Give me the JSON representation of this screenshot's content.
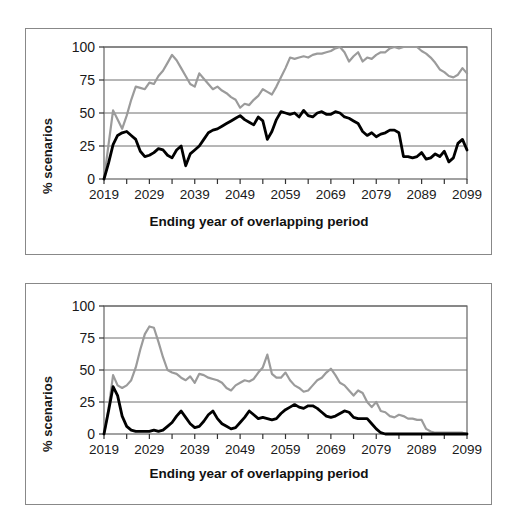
{
  "figure": {
    "background_color": "#ffffff",
    "frame_color": "#888888",
    "panel_count": 2
  },
  "chart_data": [
    {
      "id": "top-chart",
      "type": "line",
      "title": "",
      "subtitle": "",
      "xlabel": "Ending year of overlapping period",
      "ylabel": "% scenarios",
      "xlim": [
        2019,
        2099
      ],
      "ylim": [
        0,
        100
      ],
      "grid": "horizontal",
      "legend": "none",
      "xticks": [
        2019,
        2029,
        2039,
        2049,
        2059,
        2069,
        2079,
        2089,
        2099
      ],
      "xtick_labels": [
        "2019",
        "2029",
        "2039",
        "2049",
        "2059",
        "2069",
        "2079",
        "2089",
        "2099"
      ],
      "yticks": [
        0,
        25,
        50,
        75,
        100
      ],
      "ytick_labels": [
        "0",
        "25",
        "50",
        "75",
        "100"
      ],
      "x": [
        2019,
        2020,
        2021,
        2022,
        2023,
        2024,
        2025,
        2026,
        2027,
        2028,
        2029,
        2030,
        2031,
        2032,
        2033,
        2034,
        2035,
        2036,
        2037,
        2038,
        2039,
        2040,
        2041,
        2042,
        2043,
        2044,
        2045,
        2046,
        2047,
        2048,
        2049,
        2050,
        2051,
        2052,
        2053,
        2054,
        2055,
        2056,
        2057,
        2058,
        2059,
        2060,
        2061,
        2062,
        2063,
        2064,
        2065,
        2066,
        2067,
        2068,
        2069,
        2070,
        2071,
        2072,
        2073,
        2074,
        2075,
        2076,
        2077,
        2078,
        2079,
        2080,
        2081,
        2082,
        2083,
        2084,
        2085,
        2086,
        2087,
        2088,
        2089,
        2090,
        2091,
        2092,
        2093,
        2094,
        2095,
        2096,
        2097,
        2098,
        2099
      ],
      "series": [
        {
          "name": "gray-series",
          "color": "#9b9b9b",
          "width": 2.2,
          "values": [
            0,
            26,
            52,
            45,
            38,
            48,
            60,
            70,
            69,
            68,
            73,
            72,
            78,
            82,
            88,
            94,
            90,
            84,
            78,
            72,
            70,
            80,
            76,
            72,
            68,
            70,
            67,
            65,
            62,
            60,
            54,
            57,
            56,
            60,
            63,
            68,
            66,
            64,
            70,
            77,
            84,
            92,
            91,
            92,
            93,
            92,
            94,
            95,
            95,
            96,
            97,
            99,
            100,
            96,
            89,
            93,
            96,
            89,
            92,
            91,
            94,
            96,
            96,
            99,
            100,
            99,
            100,
            100,
            100,
            100,
            97,
            95,
            92,
            88,
            83,
            81,
            78,
            77,
            79,
            84,
            80,
            84,
            88,
            84,
            81,
            84,
            89,
            92
          ]
        },
        {
          "name": "black-series",
          "color": "#000000",
          "width": 2.8,
          "values": [
            0,
            12,
            26,
            33,
            35,
            36,
            33,
            30,
            21,
            17,
            18,
            20,
            23,
            22,
            18,
            16,
            22,
            25,
            10,
            19,
            22,
            25,
            30,
            35,
            37,
            38,
            40,
            42,
            44,
            46,
            48,
            45,
            43,
            41,
            47,
            44,
            30,
            36,
            45,
            51,
            50,
            49,
            50,
            47,
            52,
            48,
            47,
            50,
            51,
            49,
            49,
            51,
            50,
            47,
            46,
            44,
            42,
            36,
            33,
            35,
            32,
            34,
            35,
            37,
            37,
            35,
            17,
            17,
            16,
            17,
            20,
            15,
            16,
            19,
            17,
            21,
            13,
            16,
            27,
            30,
            22,
            27,
            26,
            30,
            26,
            24,
            25,
            26,
            19,
            28
          ]
        }
      ]
    },
    {
      "id": "bottom-chart",
      "type": "line",
      "title": "",
      "subtitle": "",
      "xlabel": "Ending year of overlapping period",
      "ylabel": "% scenarios",
      "xlim": [
        2019,
        2099
      ],
      "ylim": [
        0,
        100
      ],
      "grid": "horizontal",
      "legend": "none",
      "xticks": [
        2019,
        2029,
        2039,
        2049,
        2059,
        2069,
        2079,
        2089,
        2099
      ],
      "xtick_labels": [
        "2019",
        "2029",
        "2039",
        "2049",
        "2059",
        "2069",
        "2079",
        "2089",
        "2099"
      ],
      "yticks": [
        0,
        25,
        50,
        75,
        100
      ],
      "ytick_labels": [
        "0",
        "25",
        "50",
        "75",
        "100"
      ],
      "x": [
        2019,
        2020,
        2021,
        2022,
        2023,
        2024,
        2025,
        2026,
        2027,
        2028,
        2029,
        2030,
        2031,
        2032,
        2033,
        2034,
        2035,
        2036,
        2037,
        2038,
        2039,
        2040,
        2041,
        2042,
        2043,
        2044,
        2045,
        2046,
        2047,
        2048,
        2049,
        2050,
        2051,
        2052,
        2053,
        2054,
        2055,
        2056,
        2057,
        2058,
        2059,
        2060,
        2061,
        2062,
        2063,
        2064,
        2065,
        2066,
        2067,
        2068,
        2069,
        2070,
        2071,
        2072,
        2073,
        2074,
        2075,
        2076,
        2077,
        2078,
        2079,
        2080,
        2081,
        2082,
        2083,
        2084,
        2085,
        2086,
        2087,
        2088,
        2089,
        2090,
        2091,
        2092,
        2093,
        2094,
        2095,
        2096,
        2097,
        2098,
        2099
      ],
      "series": [
        {
          "name": "gray-series",
          "color": "#9b9b9b",
          "width": 2.2,
          "values": [
            0,
            20,
            46,
            38,
            36,
            38,
            42,
            52,
            66,
            78,
            84,
            83,
            72,
            60,
            50,
            48,
            47,
            44,
            42,
            45,
            40,
            47,
            46,
            44,
            43,
            42,
            40,
            36,
            34,
            38,
            40,
            42,
            41,
            43,
            48,
            52,
            62,
            47,
            44,
            44,
            48,
            42,
            38,
            36,
            33,
            34,
            38,
            42,
            44,
            48,
            51,
            46,
            40,
            38,
            34,
            30,
            34,
            32,
            25,
            21,
            25,
            18,
            17,
            14,
            13,
            15,
            14,
            12,
            12,
            11,
            11,
            4,
            2,
            1,
            1,
            1,
            1,
            1,
            1,
            1,
            0
          ]
        },
        {
          "name": "black-series",
          "color": "#000000",
          "width": 2.8,
          "values": [
            0,
            18,
            37,
            30,
            14,
            6,
            3,
            2,
            2,
            2,
            2,
            3,
            2,
            3,
            6,
            9,
            14,
            18,
            13,
            8,
            5,
            6,
            10,
            15,
            18,
            12,
            8,
            6,
            4,
            5,
            9,
            13,
            18,
            15,
            12,
            13,
            12,
            11,
            12,
            16,
            19,
            21,
            23,
            21,
            20,
            22,
            22,
            20,
            17,
            14,
            13,
            14,
            16,
            18,
            17,
            13,
            12,
            12,
            12,
            8,
            4,
            1,
            0,
            0,
            0,
            0,
            0,
            0,
            0,
            0,
            0,
            0,
            0,
            0,
            0,
            0,
            0,
            0,
            0,
            0,
            0
          ]
        }
      ]
    }
  ]
}
